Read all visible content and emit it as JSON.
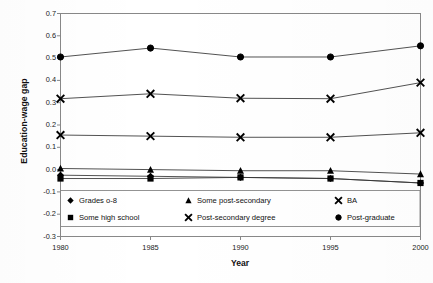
{
  "chart_data": {
    "type": "line",
    "title": "",
    "xlabel": "Year",
    "ylabel": "Education-wage gap",
    "x": [
      1980,
      1985,
      1990,
      1995,
      2000
    ],
    "xtick_labels": [
      "1980",
      "1985",
      "1990",
      "1995",
      "2000"
    ],
    "ytick_labels": [
      "0.7",
      "0.6",
      "0.5",
      "0.4",
      "0.3",
      "0.2",
      "0.1",
      "0.0",
      "-0.1",
      "-0.2",
      "-0.3"
    ],
    "ytick_values": [
      0.7,
      0.6,
      0.5,
      0.4,
      0.3,
      0.2,
      0.1,
      0.0,
      -0.1,
      -0.2,
      -0.3
    ],
    "ylim": [
      -0.3,
      0.7
    ],
    "xlim": [
      1980,
      2000
    ],
    "grid": false,
    "legend_position": "inside-bottom-left",
    "series": [
      {
        "name": "Grades 0-8",
        "marker": "diamond",
        "values": [
          -0.025,
          -0.03,
          -0.035,
          -0.04,
          -0.06
        ]
      },
      {
        "name": "Some high school",
        "marker": "square",
        "values": [
          -0.04,
          -0.04,
          -0.035,
          -0.04,
          -0.06
        ]
      },
      {
        "name": "Some post-secondary",
        "marker": "triangle",
        "values": [
          0.005,
          0.0,
          -0.005,
          -0.005,
          -0.02
        ]
      },
      {
        "name": "Post-secondary degree",
        "marker": "cross",
        "values": [
          0.155,
          0.15,
          0.145,
          0.145,
          0.165
        ]
      },
      {
        "name": "BA",
        "marker": "cross",
        "values": [
          0.318,
          0.34,
          0.32,
          0.318,
          0.39
        ]
      },
      {
        "name": "Post-graduate",
        "marker": "circle",
        "values": [
          0.505,
          0.545,
          0.505,
          0.505,
          0.555
        ]
      }
    ],
    "colors": {
      "line": "#333333",
      "marker": "#000000",
      "axis": "#888888",
      "text": "#111111"
    }
  },
  "legend": {
    "entries": [
      {
        "label": "Grades o-8",
        "marker": "diamond"
      },
      {
        "label": "Some post-secondary",
        "marker": "triangle"
      },
      {
        "label": "BA",
        "marker": "cross"
      },
      {
        "label": "Some high school",
        "marker": "square"
      },
      {
        "label": "Post-secondary degree",
        "marker": "cross"
      },
      {
        "label": "Post-graduate",
        "marker": "circle"
      }
    ]
  },
  "axes": {
    "x_title": "Year",
    "y_title": "Education-wage gap"
  }
}
